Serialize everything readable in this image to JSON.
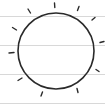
{
  "icon": {
    "name": "sun-icon",
    "stroke_color": "#2a2a2a",
    "background_color": "#ffffff",
    "rule_line_color": "#d8d8d8",
    "circle": {
      "cx": 56,
      "cy": 51,
      "r": 38
    },
    "ray_count": 12
  }
}
